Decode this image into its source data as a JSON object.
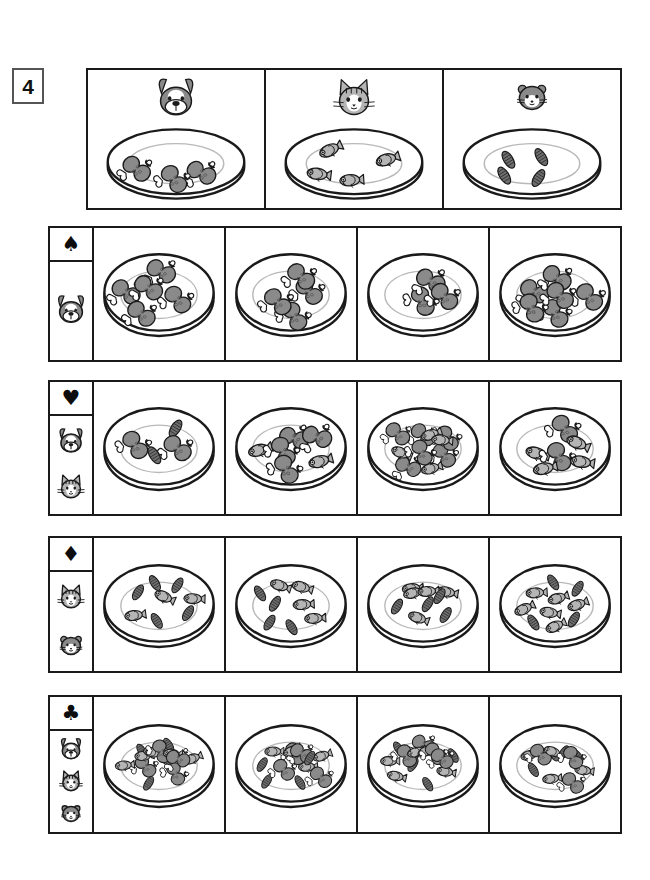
{
  "worksheet": {
    "exercise_number": "4",
    "colors": {
      "ink": "#1a1a1a",
      "meat": "#8a8a8a",
      "meat_dark": "#5a5a5a",
      "fish_body": "#b5b5b5",
      "seed": "#6e6e6e",
      "bone": "#ffffff",
      "plate": "#ffffff"
    },
    "food_icons": {
      "drumstick": "drumstick-icon",
      "fish": "fish-icon",
      "seed": "seed-icon"
    },
    "animal_icons": {
      "dog": "dog-icon",
      "cat": "cat-icon",
      "hamster": "hamster-icon"
    },
    "suit_icons": {
      "spade": "spade-icon",
      "heart": "heart-icon",
      "diamond": "diamond-icon",
      "club": "club-icon"
    }
  },
  "header": {
    "cells": [
      {
        "animal": "dog",
        "animal_glyph": "dog-icon",
        "food": "drumstick",
        "count": 3
      },
      {
        "animal": "cat",
        "animal_glyph": "cat-icon",
        "food": "fish",
        "count": 4
      },
      {
        "animal": "hamster",
        "animal_glyph": "hamster-icon",
        "food": "seed",
        "count": 4
      }
    ]
  },
  "rows": [
    {
      "suit": "spade",
      "suit_glyph": "♠",
      "animals": [
        "dog"
      ],
      "cells": [
        {
          "drumstick": 5,
          "fish": 0,
          "seed": 0,
          "total": 5
        },
        {
          "drumstick": 4,
          "fish": 0,
          "seed": 0,
          "total": 4
        },
        {
          "drumstick": 3,
          "fish": 0,
          "seed": 0,
          "total": 3
        },
        {
          "drumstick": 6,
          "fish": 0,
          "seed": 0,
          "total": 6
        }
      ]
    },
    {
      "suit": "heart",
      "suit_glyph": "♥",
      "animals": [
        "dog",
        "cat"
      ],
      "cells": [
        {
          "drumstick": 2,
          "fish": 0,
          "seed": 2,
          "total": 4
        },
        {
          "drumstick": 4,
          "fish": 2,
          "seed": 0,
          "total": 6
        },
        {
          "drumstick": 6,
          "fish": 4,
          "seed": 0,
          "total": 10
        },
        {
          "drumstick": 2,
          "fish": 4,
          "seed": 0,
          "total": 6
        }
      ]
    },
    {
      "suit": "diamond",
      "suit_glyph": "♦",
      "animals": [
        "cat",
        "hamster"
      ],
      "cells": [
        {
          "drumstick": 0,
          "fish": 3,
          "seed": 5,
          "total": 8
        },
        {
          "drumstick": 0,
          "fish": 4,
          "seed": 4,
          "total": 8
        },
        {
          "drumstick": 0,
          "fish": 5,
          "seed": 4,
          "total": 9
        },
        {
          "drumstick": 0,
          "fish": 6,
          "seed": 4,
          "total": 10
        }
      ]
    },
    {
      "suit": "club",
      "suit_glyph": "♣",
      "animals": [
        "dog",
        "cat",
        "hamster"
      ],
      "cells": [
        {
          "drumstick": 4,
          "fish": 5,
          "seed": 4,
          "total": 13
        },
        {
          "drumstick": 4,
          "fish": 4,
          "seed": 4,
          "total": 12
        },
        {
          "drumstick": 4,
          "fish": 5,
          "seed": 4,
          "total": 13
        },
        {
          "drumstick": 3,
          "fish": 4,
          "seed": 4,
          "total": 11
        }
      ]
    }
  ]
}
